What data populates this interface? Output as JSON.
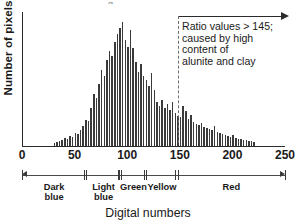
{
  "chart_data": {
    "type": "bar",
    "title": "",
    "xlabel": "Digital numbers",
    "ylabel": "Number of pixels",
    "xlim": [
      0,
      250
    ],
    "ylim": [
      0,
      134
    ],
    "grid": false,
    "legend": null,
    "bin_width": 2.5,
    "x": [
      30,
      32.5,
      35,
      37.5,
      40,
      42.5,
      45,
      47.5,
      50,
      52.5,
      55,
      57.5,
      60,
      62.5,
      65,
      67.5,
      70,
      72.5,
      75,
      77.5,
      80,
      82.5,
      85,
      87.5,
      90,
      92.5,
      95,
      97.5,
      100,
      102.5,
      105,
      107.5,
      110,
      112.5,
      115,
      117.5,
      120,
      122.5,
      125,
      127.5,
      130,
      132.5,
      135,
      137.5,
      140,
      142.5,
      145,
      147.5,
      150,
      152.5,
      155,
      157.5,
      160,
      162.5,
      165,
      167.5,
      170,
      172.5,
      175,
      177.5,
      180,
      182.5,
      185,
      187.5,
      190,
      192.5,
      195,
      197.5,
      200,
      202.5,
      205,
      207.5,
      210,
      212.5,
      215,
      217.5,
      220
    ],
    "values": [
      3,
      4,
      5,
      6,
      8,
      7,
      10,
      9,
      13,
      12,
      16,
      20,
      26,
      25,
      38,
      52,
      48,
      62,
      76,
      70,
      86,
      95,
      90,
      104,
      112,
      118,
      124,
      106,
      99,
      116,
      98,
      84,
      74,
      82,
      70,
      66,
      60,
      73,
      56,
      44,
      40,
      46,
      38,
      42,
      36,
      44,
      33,
      30,
      29,
      40,
      35,
      27,
      31,
      24,
      22,
      21,
      23,
      19,
      18,
      17,
      16,
      20,
      14,
      13,
      12,
      11,
      10,
      9,
      11,
      8,
      7,
      7,
      6,
      6,
      5,
      5,
      4
    ],
    "xticks": [
      {
        "value": 0,
        "label": "0"
      },
      {
        "value": 50,
        "label": "50"
      },
      {
        "value": 100,
        "label": "100"
      },
      {
        "value": 150,
        "label": "150"
      },
      {
        "value": 200,
        "label": "200"
      },
      {
        "value": 250,
        "label": "250"
      }
    ],
    "yticks": [],
    "annotations": [
      {
        "name": "ratio-callout",
        "lines": [
          "Ratio values > 145;",
          "caused by high",
          "content of",
          "alunite and clay"
        ],
        "marker_value": 148,
        "marker_style": "dashed",
        "arrow": {
          "from": 148,
          "to": 250,
          "direction": "right"
        }
      }
    ],
    "class_ruler": {
      "range": [
        0,
        250
      ],
      "classes": [
        {
          "label": "Dark\nblue",
          "label_lines": [
            "Dark",
            "blue"
          ],
          "start": 0,
          "end": 61
        },
        {
          "label": "Light\nblue",
          "label_lines": [
            "Light",
            "blue"
          ],
          "start": 61,
          "end": 94
        },
        {
          "label": "Green",
          "label_lines": [
            "Green"
          ],
          "start": 94,
          "end": 118
        },
        {
          "label": "Yellow",
          "label_lines": [
            "Yellow"
          ],
          "start": 118,
          "end": 148
        },
        {
          "label": "Red",
          "label_lines": [
            "Red"
          ],
          "start": 148,
          "end": 250
        }
      ]
    },
    "colors": {
      "bar": "#3a3a3a",
      "axis": "#2b2b2b",
      "dashed_marker": "#6d6d6d",
      "text": "#1a1a1a",
      "background": "#ffffff"
    }
  },
  "axis": {
    "y_title": "Number of pixels",
    "x_title": "Digital numbers"
  },
  "top_artifact": "g"
}
